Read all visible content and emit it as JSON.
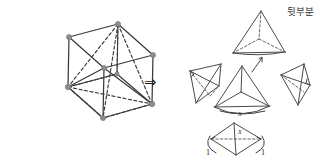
{
  "figure": {
    "background_color": "#ffffff",
    "stroke_color": "#3a3a3a",
    "vertex_color": "#8d8d8d",
    "width": 333,
    "height": 168,
    "transform_symbol": "⇒",
    "annotations": {
      "back_part": "뒷부분",
      "edge_x": "x",
      "edge_x_bottom": "x",
      "edge_one_left": "1",
      "edge_one_right": "1"
    },
    "shapes": {
      "cube_hexagon_label": "cube-hexagonal-projection",
      "top_tetra_label": "tetrahedron-back-part",
      "left_tetra_label": "tetrahedron-left",
      "center_tetra_label": "tetrahedron-center",
      "right_tetra_label": "tetrahedron-right",
      "bottom_tetra_label": "tetrahedron-bottom"
    }
  }
}
